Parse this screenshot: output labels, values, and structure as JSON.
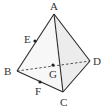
{
  "diagram": {
    "colors": {
      "edge": "#2a2a2a",
      "face_shade": "#ececec",
      "face_light": "#f7f7f7",
      "label": "#333333"
    },
    "vertices": {
      "A": {
        "label": "A",
        "x": 54,
        "y": 14,
        "lx": 50,
        "ly": 10
      },
      "B": {
        "label": "B",
        "x": 17,
        "y": 71,
        "lx": 4,
        "ly": 75
      },
      "C": {
        "label": "C",
        "x": 63,
        "y": 92,
        "lx": 60,
        "ly": 106
      },
      "D": {
        "label": "D",
        "x": 90,
        "y": 61,
        "lx": 93,
        "ly": 65
      }
    },
    "points": {
      "E": {
        "label": "E",
        "x": 35,
        "y": 41,
        "lx": 24,
        "ly": 43,
        "on": "AB"
      },
      "F": {
        "label": "F",
        "x": 40,
        "y": 82,
        "lx": 35,
        "ly": 95,
        "on": "BC"
      },
      "G": {
        "label": "G",
        "x": 53,
        "y": 65,
        "lx": 49,
        "ly": 78,
        "on": "BD"
      }
    },
    "edges_solid": [
      "AB",
      "AC",
      "AD",
      "BC",
      "CD"
    ],
    "edges_dashed": [
      "BD"
    ]
  }
}
